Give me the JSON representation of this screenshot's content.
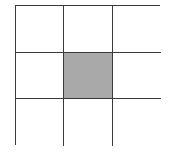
{
  "diagram": {
    "type": "grid",
    "rows": 3,
    "cols": 3,
    "shaded_cells": [
      [
        1,
        1
      ]
    ],
    "colors": {
      "line": "#3a3a3a",
      "empty_fill": "#ffffff",
      "shaded_fill": "#a9a9a9"
    },
    "cells": [
      {
        "row": 0,
        "col": 0,
        "shaded": false
      },
      {
        "row": 0,
        "col": 1,
        "shaded": false
      },
      {
        "row": 0,
        "col": 2,
        "shaded": false
      },
      {
        "row": 1,
        "col": 0,
        "shaded": false
      },
      {
        "row": 1,
        "col": 1,
        "shaded": true
      },
      {
        "row": 1,
        "col": 2,
        "shaded": false
      },
      {
        "row": 2,
        "col": 0,
        "shaded": false
      },
      {
        "row": 2,
        "col": 1,
        "shaded": false
      },
      {
        "row": 2,
        "col": 2,
        "shaded": false
      }
    ]
  }
}
